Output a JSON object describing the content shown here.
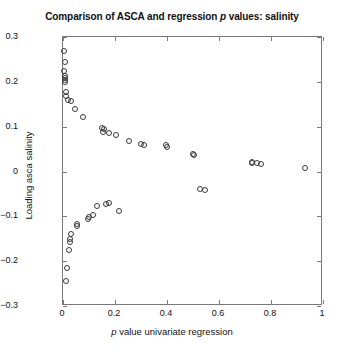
{
  "chart_data": {
    "type": "scatter",
    "title": "Comparison of ASCA and regression p values: salinity",
    "title_plain": "Comparison of ASCA and regression p values: salinity",
    "title_pre_italic": "Comparison of ASCA and regression ",
    "title_italic": "p",
    "title_post_italic": " values: salinity",
    "xlabel_pre_italic": "",
    "xlabel_italic": "p",
    "xlabel_post_italic": " value univariate regression",
    "xlabel": "p value univariate regression",
    "ylabel": "Loading asca salinity",
    "xlim": [
      0,
      1
    ],
    "ylim": [
      -0.3,
      0.3
    ],
    "xticks": [
      0,
      0.2,
      0.4,
      0.6,
      0.8,
      1
    ],
    "xticklabels": [
      "0",
      "0.2",
      "0.4",
      "0.6",
      "0.8",
      "1"
    ],
    "yticks": [
      -0.3,
      -0.2,
      -0.1,
      0,
      0.1,
      0.2,
      0.3
    ],
    "yticklabels": [
      "-0.3",
      "-0.2",
      "-0.1",
      "0",
      "0.1",
      "0.2",
      "0.3"
    ],
    "grid": false,
    "legend": null,
    "marker": "open-circle",
    "marker_color": "#3a3a3a",
    "marker_size_px": 6,
    "background_color": "#ffffff",
    "axis_color": "#7a7a7a",
    "n_points": 47,
    "x": [
      0.005,
      0.006,
      0.004,
      0.006,
      0.007,
      0.006,
      0.008,
      0.01,
      0.012,
      0.018,
      0.03,
      0.045,
      0.075,
      0.15,
      0.158,
      0.155,
      0.178,
      0.205,
      0.255,
      0.3,
      0.31,
      0.395,
      0.4,
      0.5,
      0.502,
      0.525,
      0.545,
      0.725,
      0.728,
      0.745,
      0.76,
      0.93,
      0.215,
      0.175,
      0.165,
      0.13,
      0.115,
      0.1,
      0.095,
      0.055,
      0.052,
      0.03,
      0.028,
      0.026,
      0.022,
      0.015,
      0.01
    ],
    "y": [
      0.268,
      0.245,
      0.225,
      0.212,
      0.208,
      0.205,
      0.2,
      0.178,
      0.168,
      0.16,
      0.158,
      0.14,
      0.122,
      0.098,
      0.095,
      0.088,
      0.085,
      0.082,
      0.068,
      0.062,
      0.06,
      0.058,
      0.055,
      0.038,
      0.036,
      -0.04,
      -0.042,
      0.022,
      0.02,
      0.018,
      0.016,
      0.008,
      -0.088,
      -0.07,
      -0.072,
      -0.078,
      -0.098,
      -0.102,
      -0.105,
      -0.118,
      -0.122,
      -0.14,
      -0.15,
      -0.158,
      -0.175,
      -0.215,
      -0.245
    ],
    "points": [
      {
        "x": 0.005,
        "y": 0.268
      },
      {
        "x": 0.006,
        "y": 0.245
      },
      {
        "x": 0.004,
        "y": 0.225
      },
      {
        "x": 0.006,
        "y": 0.212
      },
      {
        "x": 0.007,
        "y": 0.208
      },
      {
        "x": 0.006,
        "y": 0.205
      },
      {
        "x": 0.008,
        "y": 0.2
      },
      {
        "x": 0.01,
        "y": 0.178
      },
      {
        "x": 0.012,
        "y": 0.168
      },
      {
        "x": 0.018,
        "y": 0.16
      },
      {
        "x": 0.03,
        "y": 0.158
      },
      {
        "x": 0.045,
        "y": 0.14
      },
      {
        "x": 0.075,
        "y": 0.122
      },
      {
        "x": 0.15,
        "y": 0.098
      },
      {
        "x": 0.158,
        "y": 0.095
      },
      {
        "x": 0.155,
        "y": 0.088
      },
      {
        "x": 0.178,
        "y": 0.085
      },
      {
        "x": 0.205,
        "y": 0.082
      },
      {
        "x": 0.255,
        "y": 0.068
      },
      {
        "x": 0.3,
        "y": 0.062
      },
      {
        "x": 0.31,
        "y": 0.06
      },
      {
        "x": 0.395,
        "y": 0.058
      },
      {
        "x": 0.4,
        "y": 0.055
      },
      {
        "x": 0.5,
        "y": 0.038
      },
      {
        "x": 0.502,
        "y": 0.036
      },
      {
        "x": 0.525,
        "y": -0.04
      },
      {
        "x": 0.545,
        "y": -0.042
      },
      {
        "x": 0.725,
        "y": 0.022
      },
      {
        "x": 0.728,
        "y": 0.02
      },
      {
        "x": 0.745,
        "y": 0.018
      },
      {
        "x": 0.76,
        "y": 0.016
      },
      {
        "x": 0.93,
        "y": 0.008
      },
      {
        "x": 0.215,
        "y": -0.088
      },
      {
        "x": 0.175,
        "y": -0.07
      },
      {
        "x": 0.165,
        "y": -0.072
      },
      {
        "x": 0.13,
        "y": -0.078
      },
      {
        "x": 0.115,
        "y": -0.098
      },
      {
        "x": 0.1,
        "y": -0.102
      },
      {
        "x": 0.095,
        "y": -0.105
      },
      {
        "x": 0.055,
        "y": -0.118
      },
      {
        "x": 0.052,
        "y": -0.122
      },
      {
        "x": 0.03,
        "y": -0.14
      },
      {
        "x": 0.028,
        "y": -0.15
      },
      {
        "x": 0.026,
        "y": -0.158
      },
      {
        "x": 0.022,
        "y": -0.175
      },
      {
        "x": 0.015,
        "y": -0.215
      },
      {
        "x": 0.01,
        "y": -0.245
      }
    ]
  }
}
